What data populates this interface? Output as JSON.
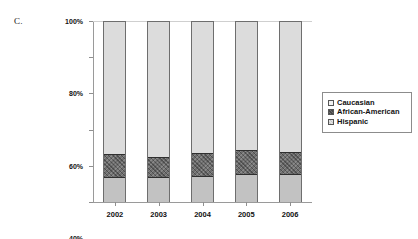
{
  "panel": {
    "label": "C."
  },
  "legend": {
    "position": "right",
    "items": [
      {
        "label": "Caucasian",
        "swatch": "caucasian-swatch"
      },
      {
        "label": "African-American",
        "swatch": "african-american-swatch"
      },
      {
        "label": "Hispanic",
        "swatch": "hispanic-swatch"
      }
    ]
  },
  "axes": {
    "y_ticks": [
      "0%",
      "20%",
      "40%",
      "60%",
      "80%",
      "100%"
    ],
    "x_ticks": [
      "2002",
      "2003",
      "2004",
      "2005",
      "2006"
    ]
  },
  "colors": {
    "caucasian": "#dcdcdc",
    "african_american": "#6f6f6f",
    "hispanic": "#c2c2c2",
    "axis": "#9a9a9a",
    "gridline": "#d9d9d9",
    "bar_outline": "#6e6e6e"
  },
  "chart_data": {
    "type": "bar",
    "stacked": true,
    "normalized": "100%",
    "title": "",
    "subtitle": "",
    "xlabel": "",
    "ylabel": "",
    "ylim": [
      0,
      100
    ],
    "yticks": [
      0,
      20,
      40,
      60,
      80,
      100
    ],
    "ytick_labels": [
      "0%",
      "20%",
      "40%",
      "60%",
      "80%",
      "100%"
    ],
    "grid": false,
    "legend_position": "right",
    "categories": [
      "2002",
      "2003",
      "2004",
      "2005",
      "2006"
    ],
    "series": [
      {
        "name": "Hispanic",
        "values": [
          13.0,
          13.0,
          14.0,
          15.0,
          15.0
        ]
      },
      {
        "name": "African-American",
        "values": [
          13.5,
          12.0,
          13.0,
          14.0,
          12.5
        ]
      },
      {
        "name": "Caucasian",
        "values": [
          73.5,
          75.0,
          73.0,
          71.0,
          72.5
        ]
      }
    ],
    "cumulative_tops": {
      "Hispanic": [
        13.0,
        13.0,
        14.0,
        15.0,
        15.0
      ],
      "African-American": [
        26.5,
        25.0,
        27.0,
        29.0,
        27.5
      ],
      "Caucasian": [
        100,
        100,
        100,
        100,
        100
      ]
    }
  }
}
